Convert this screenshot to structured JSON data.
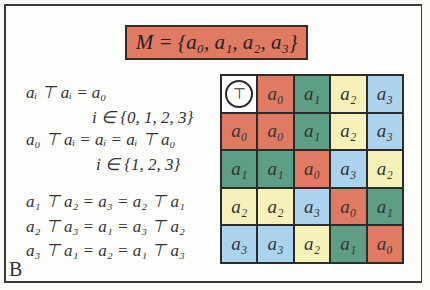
{
  "title": "M = {a₀, a₁, a₂, a₃}",
  "panel_label": "B",
  "equations": [
    {
      "text": "aᵢ ⊤ aᵢ = a₀",
      "x": 26,
      "y": 82
    },
    {
      "text": "i ∈ {0, 1, 2, 3}",
      "x": 92,
      "y": 107
    },
    {
      "text": "a₀ ⊤ aᵢ = aᵢ = aᵢ ⊤ a₀",
      "x": 26,
      "y": 129
    },
    {
      "text": "i ∈ {1, 2, 3}",
      "x": 96,
      "y": 154
    },
    {
      "text": "a₁ ⊤ a₂ = a₃ = a₂ ⊤ a₁",
      "x": 26,
      "y": 191
    },
    {
      "text": "a₂ ⊤ a₃ = a₁ = a₃ ⊤ a₂",
      "x": 26,
      "y": 216
    },
    {
      "text": "a₃ ⊤ a₁ = a₂ = a₁ ⊤ a₃",
      "x": 26,
      "y": 240
    }
  ],
  "table": {
    "operator": "⊤",
    "header_row": [
      "a₀",
      "a₁",
      "a₂",
      "a₃"
    ],
    "rows": [
      {
        "head": "a₀",
        "cells": [
          "a₀",
          "a₁",
          "a₂",
          "a₃"
        ]
      },
      {
        "head": "a₁",
        "cells": [
          "a₁",
          "a₀",
          "a₃",
          "a₂"
        ]
      },
      {
        "head": "a₂",
        "cells": [
          "a₂",
          "a₃",
          "a₀",
          "a₁"
        ]
      },
      {
        "head": "a₃",
        "cells": [
          "a₃",
          "a₂",
          "a₁",
          "a₀"
        ]
      }
    ]
  },
  "colors": {
    "a0": "#e07a62",
    "a1": "#5e9e85",
    "a2": "#f5f1b8",
    "a3": "#acd3ee"
  }
}
